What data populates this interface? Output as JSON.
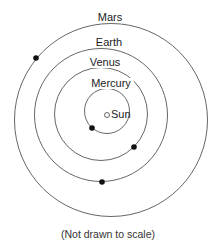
{
  "diagram": {
    "caption": "(Not drawn to scale)",
    "sun": {
      "label": "Sun",
      "cx": 107,
      "cy": 115,
      "r": 2.5
    },
    "orbits": [
      {
        "name": "Mercury",
        "label": "Mercury",
        "cx": 107,
        "cy": 111,
        "r": 22.5,
        "label_x": 111,
        "label_y": 87,
        "planet": {
          "cx": 92,
          "cy": 128
        }
      },
      {
        "name": "Venus",
        "label": "Venus",
        "cx": 101,
        "cy": 114,
        "r": 46.5,
        "label_x": 105,
        "label_y": 66,
        "planet": {
          "cx": 134,
          "cy": 147
        }
      },
      {
        "name": "Earth",
        "label": "Earth",
        "cx": 101,
        "cy": 115,
        "r": 66.5,
        "label_x": 109,
        "label_y": 46,
        "planet": {
          "cx": 102,
          "cy": 182
        }
      },
      {
        "name": "Mars",
        "label": "Mars",
        "cx": 111,
        "cy": 120,
        "r": 96.5,
        "label_x": 110,
        "label_y": 21,
        "planet": {
          "cx": 36,
          "cy": 58
        }
      }
    ],
    "colors": {
      "orbit": "#555555",
      "planet": "#111111",
      "background": "#ffffff"
    }
  }
}
